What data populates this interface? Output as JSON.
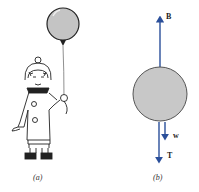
{
  "figure": {
    "panel_a": {
      "caption": "(a)",
      "description": "child holding a balloon on a string"
    },
    "panel_b": {
      "caption": "(b)",
      "description": "free-body diagram of balloon",
      "forces": [
        {
          "label": "B",
          "name": "buoyant force",
          "direction": "up"
        },
        {
          "label": "w",
          "name": "weight",
          "direction": "down"
        },
        {
          "label": "T",
          "name": "tension",
          "direction": "down"
        }
      ]
    },
    "colors": {
      "arrow": "#2a4f9a",
      "balloon_fill": "#c8c8c8",
      "outline": "#333333"
    }
  }
}
